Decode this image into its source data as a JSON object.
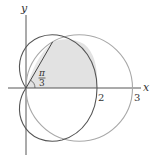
{
  "figure": {
    "axes": {
      "x_label": "x",
      "y_label": "y",
      "x_ticks": [
        {
          "value": 2,
          "label": "2"
        },
        {
          "value": 3,
          "label": "3"
        }
      ]
    },
    "angle_label": {
      "numerator": "π",
      "denominator": "3"
    },
    "curves": [
      {
        "name": "cardioid",
        "equation": "r = 1 + cos θ",
        "color": "#555555"
      },
      {
        "name": "circle",
        "equation": "r = 3 cos θ",
        "color": "#a8a8a8"
      }
    ],
    "shaded_region": {
      "color": "#e2e2e2",
      "from_angle": "0",
      "to_angle": "π/3"
    },
    "intersection_angle": "π/3"
  }
}
